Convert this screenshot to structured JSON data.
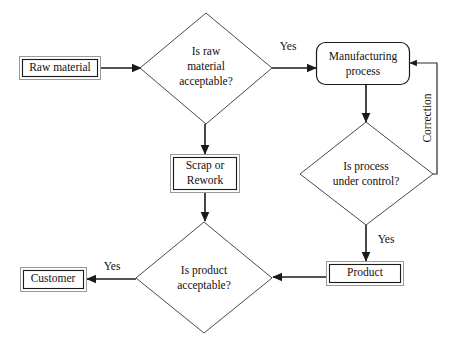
{
  "diagram": {
    "background_color": "#ffffff",
    "line_color": "#1a1a1a",
    "shape_stroke_color": "#4a4a4a",
    "text_color": "#111111"
  },
  "nodes": {
    "raw_material": {
      "label": "Raw material",
      "shape": "rectangle"
    },
    "is_raw_material_acceptable": {
      "label_line1": "Is raw",
      "label_line2": "material",
      "label_line3": "acceptable?",
      "shape": "diamond"
    },
    "manufacturing_process": {
      "label_line1": "Manufacturing",
      "label_line2": "process",
      "shape": "rounded-rectangle"
    },
    "scrap_or_rework": {
      "label_line1": "Scrap or",
      "label_line2": "Rework",
      "shape": "rectangle"
    },
    "is_process_under_control": {
      "label_line1": "Is process",
      "label_line2": "under control?",
      "shape": "diamond"
    },
    "product": {
      "label": "Product",
      "shape": "rectangle"
    },
    "is_product_acceptable": {
      "label_line1": "Is product",
      "label_line2": "acceptable?",
      "shape": "diamond"
    },
    "customer": {
      "label": "Customer",
      "shape": "rectangle"
    }
  },
  "edge_labels": {
    "raw_yes": "Yes",
    "correction": "Correction",
    "process_yes": "Yes",
    "product_yes": "Yes"
  }
}
